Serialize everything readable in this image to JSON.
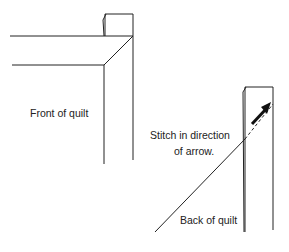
{
  "diagram": {
    "labels": {
      "front": "Front of quilt",
      "stitch_line1": "Stitch in direction",
      "stitch_line2": "of arrow.",
      "back": "Back of quilt"
    },
    "colors": {
      "line": "#222222",
      "background": "#ffffff"
    }
  }
}
